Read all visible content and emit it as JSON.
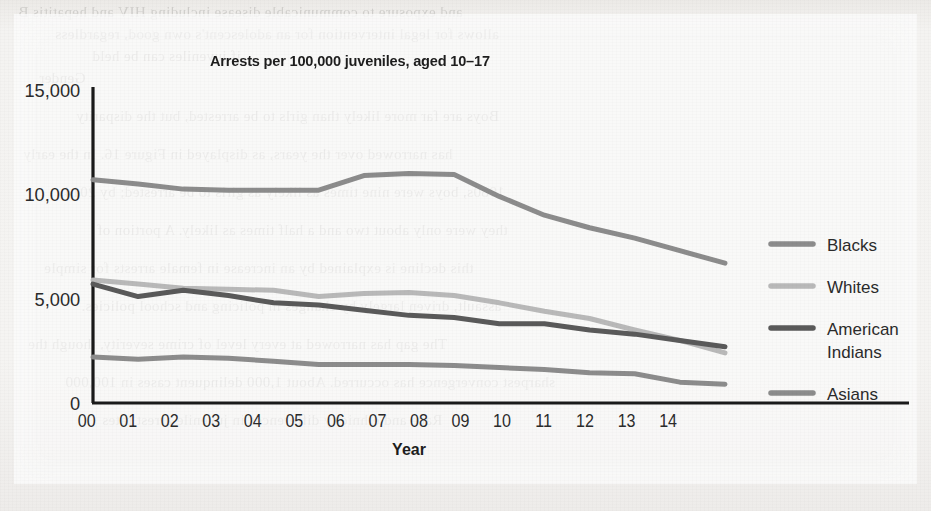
{
  "page": {
    "background_color": "#f2f1ef",
    "ghost_text_lines": [
      "and exposure to communicable disease including HIV and hepatitis B",
      "allows for legal intervention for an adolescent's own good, regardless",
      "if juveniles can be held",
      "Gender",
      "Boys are far more likely than girls to be arrested, but the disparity",
      "has narrowed over the years, as displayed in Figure 16. In the early",
      "1980s, boys were nine times as likely as girls to be arrested; by 2014,",
      "they were only about two and a half times as likely. A portion of",
      "this decline is explained by an increase in female arrests for simple",
      "assault, driven largely by changes in policing and school policies.",
      "The gap has narrowed at every level of crime severity, though the",
      "sharpest convergence has occurred. About 1,000 delinquent cases in 100,000",
      "Race and ethnicity differences in juvenile arrest rates"
    ]
  },
  "chart_data": {
    "type": "line",
    "title": "Arrests per 100,000 juveniles, aged 10–17",
    "xlabel": "Year",
    "ylabel": "",
    "categories": [
      "00",
      "01",
      "02",
      "03",
      "04",
      "05",
      "06",
      "07",
      "08",
      "09",
      "10",
      "11",
      "12",
      "13",
      "14"
    ],
    "ylim": [
      0,
      15000
    ],
    "yticks": [
      0,
      5000,
      10000,
      15000
    ],
    "ytick_labels": [
      "0",
      "5,000",
      "10,000",
      "15,000"
    ],
    "grid": false,
    "legend_position": "right",
    "series": [
      {
        "name": "Blacks",
        "color": "#8c8c8c",
        "values": [
          10700,
          10500,
          10250,
          10200,
          10200,
          10200,
          10900,
          11000,
          10950,
          9900,
          9000,
          8400,
          7900,
          7300,
          6700
        ]
      },
      {
        "name": "Whites",
        "color": "#b9b9b9",
        "values": [
          5900,
          5700,
          5500,
          5450,
          5400,
          5100,
          5250,
          5300,
          5150,
          4800,
          4400,
          4050,
          3500,
          3000,
          2400
        ]
      },
      {
        "name": "American Indians",
        "color": "#5a5a5a",
        "values": [
          5700,
          5100,
          5400,
          5150,
          4800,
          4700,
          4450,
          4200,
          4100,
          3800,
          3800,
          3500,
          3300,
          3000,
          2700
        ]
      },
      {
        "name": "Asians",
        "color": "#8c8c8c",
        "values": [
          2200,
          2100,
          2200,
          2150,
          2000,
          1850,
          1850,
          1850,
          1800,
          1700,
          1600,
          1450,
          1400,
          1000,
          900
        ]
      }
    ]
  },
  "legend": {
    "items": [
      {
        "label": "Blacks",
        "color": "#8c8c8c"
      },
      {
        "label": "Whites",
        "color": "#b9b9b9"
      },
      {
        "label": "American",
        "label2": "Indians",
        "color": "#5a5a5a"
      },
      {
        "label": "Asians",
        "color": "#8c8c8c"
      }
    ]
  },
  "axis": {
    "line_color": "#1a1a1a",
    "x_title": "Year"
  }
}
